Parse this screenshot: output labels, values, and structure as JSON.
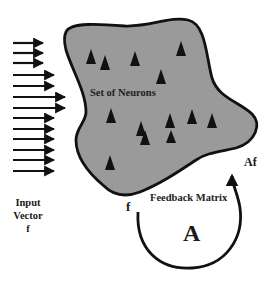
{
  "diagram": {
    "blob_label": "Set of Neurons",
    "input_label": {
      "lines": [
        "Input",
        "Vector",
        "f"
      ]
    },
    "feedback": {
      "label": "Feedback Matrix",
      "matrix_symbol": "A",
      "input_symbol": "f",
      "output_symbol": "Af"
    },
    "colors": {
      "blob_fill": "#9a9a9a",
      "outline": "#111111",
      "neuron": "#111111",
      "background": "#ffffff"
    },
    "input_arrows_count": 13,
    "neuron_count": 13
  }
}
